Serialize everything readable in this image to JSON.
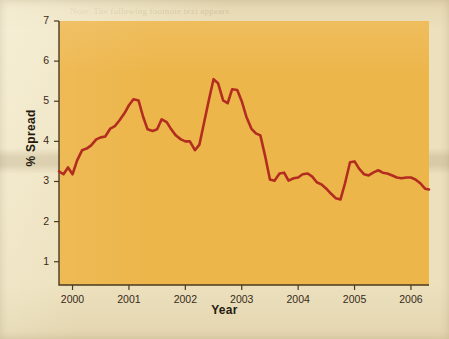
{
  "figure": {
    "panel_color": "#edb64b",
    "paper_color": "#ece0bd",
    "line_color": "#b22d20",
    "axis_color": "#4a3a20"
  },
  "chart_data": {
    "type": "line",
    "title": "",
    "xlabel": "Year",
    "ylabel": "% Spread",
    "xlim": [
      1999.76,
      2006.32
    ],
    "ylim": [
      0.42,
      7.0
    ],
    "xticks": [
      "2000",
      "2001",
      "2002",
      "2003",
      "2004",
      "2005",
      "2006"
    ],
    "yticks": [
      "1",
      "2",
      "3",
      "4",
      "5",
      "6",
      "7"
    ],
    "grid": false,
    "legend": "none",
    "series": [
      {
        "name": "% Spread",
        "color": "#b22d20",
        "x": [
          1999.76,
          1999.84,
          1999.92,
          2000.0,
          2000.08,
          2000.17,
          2000.25,
          2000.33,
          2000.42,
          2000.5,
          2000.58,
          2000.67,
          2000.75,
          2000.83,
          2000.92,
          2001.0,
          2001.08,
          2001.17,
          2001.25,
          2001.33,
          2001.42,
          2001.5,
          2001.58,
          2001.67,
          2001.75,
          2001.83,
          2001.92,
          2002.0,
          2002.08,
          2002.17,
          2002.25,
          2002.33,
          2002.42,
          2002.5,
          2002.58,
          2002.67,
          2002.75,
          2002.83,
          2002.92,
          2003.0,
          2003.08,
          2003.17,
          2003.25,
          2003.33,
          2003.42,
          2003.5,
          2003.58,
          2003.67,
          2003.75,
          2003.83,
          2003.92,
          2004.0,
          2004.08,
          2004.17,
          2004.25,
          2004.33,
          2004.42,
          2004.5,
          2004.58,
          2004.67,
          2004.75,
          2004.83,
          2004.92,
          2005.0,
          2005.08,
          2005.17,
          2005.25,
          2005.33,
          2005.42,
          2005.5,
          2005.58,
          2005.67,
          2005.75,
          2005.83,
          2005.92,
          2006.0,
          2006.08,
          2006.17,
          2006.25,
          2006.32
        ],
        "y": [
          3.25,
          3.18,
          3.35,
          3.18,
          3.52,
          3.78,
          3.82,
          3.9,
          4.05,
          4.1,
          4.12,
          4.32,
          4.38,
          4.52,
          4.7,
          4.9,
          5.05,
          5.02,
          4.62,
          4.3,
          4.26,
          4.3,
          4.55,
          4.48,
          4.3,
          4.15,
          4.05,
          4.0,
          4.0,
          3.78,
          3.92,
          4.45,
          5.05,
          5.55,
          5.45,
          5.02,
          4.95,
          5.3,
          5.28,
          5.0,
          4.62,
          4.32,
          4.2,
          4.15,
          3.6,
          3.05,
          3.02,
          3.2,
          3.22,
          3.02,
          3.08,
          3.1,
          3.18,
          3.2,
          3.12,
          2.98,
          2.92,
          2.82,
          2.7,
          2.58,
          2.55,
          2.95,
          3.48,
          3.5,
          3.32,
          3.18,
          3.15,
          3.22,
          3.28,
          3.22,
          3.2,
          3.15,
          3.1,
          3.08,
          3.1,
          3.1,
          3.05,
          2.95,
          2.82,
          2.8
        ]
      }
    ]
  },
  "ghost_text": {
    "lines": [
      "Note: The following footnote text appears",
      "in the background of the scanned page",
      "and is not part of the figure itself.",
      "Using Bond Yields to Value Equity",
      "and rates. The spread is the difference",
      "between the yield on corporate bonds",
      "and the yield on Treasury securities of",
      "comparable maturity. The spread",
      "measures the premium that investors",
      "require to hold corporate credit risk.",
      "The average spread over the period",
      "shown was about 3.8 percent, with a",
      "peak near 5.5 percent in 2002 and a",
      "low of roughly 2.5 percent in late 2004.",
      "applying the same approach to equity",
      "risk premiums leads to similar results",
      "over the sample period considered here."
    ]
  }
}
